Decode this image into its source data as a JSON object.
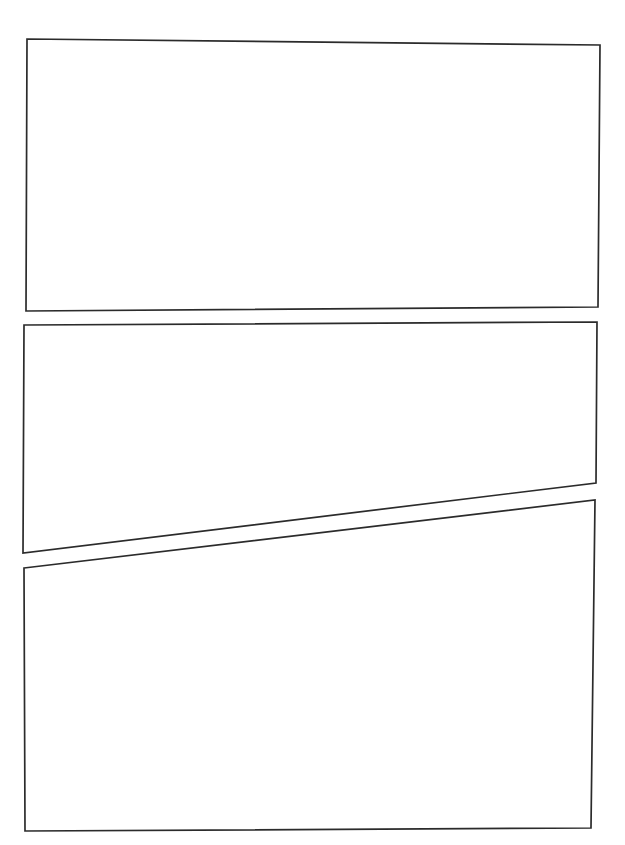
{
  "page": {
    "kind": "comic-page-layout",
    "width": 625,
    "height": 845,
    "background_color": "#ffffff",
    "panel_count": 3,
    "style": "hand-drawn blank manga / comic panel template",
    "content_text": ""
  },
  "ink": {
    "stroke_color": "#2b2b2b",
    "stroke_width": 1.7,
    "fill_color": "#ffffff",
    "line_join": "miter"
  },
  "panels": [
    {
      "id": "panel-1",
      "label": "Panel 1",
      "position": "top",
      "order": 1,
      "caption": "",
      "dialogue": "",
      "points": "27,39 600,45 598,307 26,311",
      "corners": {
        "top_left": [
          27,
          39
        ],
        "top_right": [
          600,
          45
        ],
        "bottom_right": [
          598,
          307
        ],
        "bottom_left": [
          26,
          311
        ]
      },
      "approx_width": 573,
      "approx_height": 270
    },
    {
      "id": "panel-2",
      "label": "Panel 2",
      "position": "middle",
      "order": 2,
      "caption": "",
      "dialogue": "",
      "points": "24,325 597,322 596,483 23,553",
      "corners": {
        "top_left": [
          24,
          325
        ],
        "top_right": [
          597,
          322
        ],
        "bottom_right": [
          596,
          483
        ],
        "bottom_left": [
          23,
          553
        ]
      },
      "approx_width": 573,
      "approx_height": 205,
      "note": "bottom edge slants upward to the right"
    },
    {
      "id": "panel-3",
      "label": "Panel 3",
      "position": "bottom",
      "order": 3,
      "caption": "",
      "dialogue": "",
      "points": "24,568 595,500 591,828 25,831",
      "corners": {
        "top_left": [
          24,
          568
        ],
        "top_right": [
          595,
          500
        ],
        "bottom_right": [
          591,
          828
        ],
        "bottom_left": [
          25,
          831
        ]
      },
      "approx_width": 570,
      "approx_height": 285,
      "note": "top edge slants upward to the right, parallel to panel 2 bottom"
    }
  ],
  "gutters": [
    {
      "id": "gutter-1-2",
      "between": [
        "panel-1",
        "panel-2"
      ],
      "orientation": "horizontal",
      "approx_gap": 15
    },
    {
      "id": "gutter-2-3",
      "between": [
        "panel-2",
        "panel-3"
      ],
      "orientation": "diagonal",
      "approx_gap": 16
    }
  ]
}
